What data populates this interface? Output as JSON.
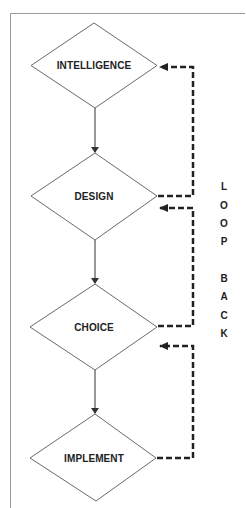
{
  "diagram": {
    "type": "flowchart",
    "colors": {
      "frame": "#9a9a9a",
      "diamond_stroke": "#6a6a6a",
      "arrow": "#333333",
      "feedback": "#222222",
      "text": "#222222"
    },
    "nodes": [
      {
        "id": "intelligence",
        "label": "INTELLIGENCE",
        "shape": "diamond"
      },
      {
        "id": "design",
        "label": "DESIGN",
        "shape": "diamond"
      },
      {
        "id": "choice",
        "label": "CHOICE",
        "shape": "diamond"
      },
      {
        "id": "implement",
        "label": "IMPLEMENT",
        "shape": "diamond"
      }
    ],
    "flow_edges": [
      {
        "from": "intelligence",
        "to": "design",
        "style": "solid"
      },
      {
        "from": "design",
        "to": "choice",
        "style": "solid"
      },
      {
        "from": "choice",
        "to": "implement",
        "style": "solid"
      }
    ],
    "feedback_edges": [
      {
        "from": "design",
        "to": "intelligence",
        "style": "dashed"
      },
      {
        "from": "choice",
        "to": "design",
        "style": "dashed"
      },
      {
        "from": "implement",
        "to": "choice",
        "style": "dashed"
      }
    ],
    "side_label": {
      "text": "LOOP BACK",
      "letters": [
        "L",
        "O",
        "O",
        "P",
        "B",
        "A",
        "C",
        "K"
      ]
    }
  }
}
